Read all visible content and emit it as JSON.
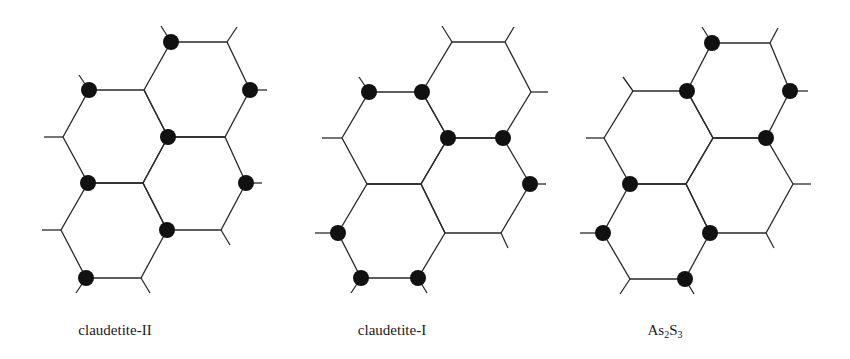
{
  "figure": {
    "colors": {
      "line": "#2a2a2a",
      "atom": "#111111",
      "background": "#ffffff"
    },
    "atom_radius": 8,
    "panels": [
      {
        "name": "claudetite-II",
        "label": "claudetite-II",
        "label_x": 115,
        "hexagons": [
          [
            [
              171,
              42
            ],
            [
              227,
              42
            ],
            [
              250,
              90
            ],
            [
              225,
              137
            ],
            [
              168,
              137
            ],
            [
              144,
              90
            ]
          ],
          [
            [
              89,
              90
            ],
            [
              144,
              90
            ],
            [
              168,
              137
            ],
            [
              143,
              183
            ],
            [
              88,
              183
            ],
            [
              63,
              137
            ]
          ],
          [
            [
              168,
              137
            ],
            [
              225,
              137
            ],
            [
              246,
              183
            ],
            [
              221,
              230
            ],
            [
              167,
              230
            ],
            [
              143,
              183
            ]
          ],
          [
            [
              88,
              183
            ],
            [
              143,
              183
            ],
            [
              167,
              230
            ],
            [
              141,
              278
            ],
            [
              86,
              278
            ],
            [
              61,
              230
            ]
          ]
        ],
        "stubs": [
          [
            [
              171,
              42
            ],
            [
              161,
              26
            ]
          ],
          [
            [
              227,
              42
            ],
            [
              237,
              27
            ]
          ],
          [
            [
              250,
              90
            ],
            [
              267,
              90
            ]
          ],
          [
            [
              89,
              90
            ],
            [
              79,
              75
            ]
          ],
          [
            [
              63,
              137
            ],
            [
              44,
              137
            ]
          ],
          [
            [
              246,
              183
            ],
            [
              262,
              183
            ]
          ],
          [
            [
              221,
              230
            ],
            [
              230,
              245
            ]
          ],
          [
            [
              61,
              230
            ],
            [
              42,
              230
            ]
          ],
          [
            [
              86,
              278
            ],
            [
              76,
              293
            ]
          ],
          [
            [
              141,
              278
            ],
            [
              150,
              293
            ]
          ]
        ],
        "atoms": [
          [
            171,
            42
          ],
          [
            89,
            90
          ],
          [
            250,
            90
          ],
          [
            168,
            137
          ],
          [
            88,
            183
          ],
          [
            246,
            183
          ],
          [
            167,
            230
          ],
          [
            86,
            278
          ]
        ]
      },
      {
        "name": "claudetite-I",
        "label": "claudetite-I",
        "label_x": 392,
        "hexagons": [
          [
            [
              452,
              42
            ],
            [
              505,
              42
            ],
            [
              531,
              92
            ],
            [
              503,
              138
            ],
            [
              448,
              138
            ],
            [
              422,
              92
            ]
          ],
          [
            [
              369,
              92
            ],
            [
              422,
              92
            ],
            [
              448,
              138
            ],
            [
              421,
              184
            ],
            [
              367,
              184
            ],
            [
              342,
              138
            ]
          ],
          [
            [
              448,
              138
            ],
            [
              503,
              138
            ],
            [
              530,
              184
            ],
            [
              501,
              233
            ],
            [
              445,
              233
            ],
            [
              421,
              184
            ]
          ],
          [
            [
              367,
              184
            ],
            [
              421,
              184
            ],
            [
              445,
              233
            ],
            [
              418,
              278
            ],
            [
              361,
              278
            ],
            [
              338,
              233
            ]
          ]
        ],
        "stubs": [
          [
            [
              452,
              42
            ],
            [
              442,
              26
            ]
          ],
          [
            [
              505,
              42
            ],
            [
              514,
              27
            ]
          ],
          [
            [
              531,
              92
            ],
            [
              548,
              92
            ]
          ],
          [
            [
              369,
              92
            ],
            [
              359,
              77
            ]
          ],
          [
            [
              342,
              138
            ],
            [
              322,
              138
            ]
          ],
          [
            [
              530,
              184
            ],
            [
              546,
              184
            ]
          ],
          [
            [
              501,
              233
            ],
            [
              508,
              248
            ]
          ],
          [
            [
              338,
              233
            ],
            [
              315,
              233
            ]
          ],
          [
            [
              361,
              278
            ],
            [
              351,
              293
            ]
          ],
          [
            [
              418,
              278
            ],
            [
              427,
              293
            ]
          ]
        ],
        "atoms": [
          [
            369,
            92
          ],
          [
            422,
            92
          ],
          [
            448,
            138
          ],
          [
            503,
            138
          ],
          [
            530,
            184
          ],
          [
            338,
            233
          ],
          [
            361,
            278
          ],
          [
            418,
            278
          ]
        ]
      },
      {
        "name": "As2S3",
        "label": "As",
        "label_sub1": "2",
        "label_mid": "S",
        "label_sub2": "3",
        "label_x": 665,
        "hexagons": [
          [
            [
              712,
              43
            ],
            [
              770,
              43
            ],
            [
              790,
              91
            ],
            [
              766,
              138
            ],
            [
              713,
              138
            ],
            [
              687,
              91
            ]
          ],
          [
            [
              633,
              91
            ],
            [
              687,
              91
            ],
            [
              713,
              138
            ],
            [
              686,
              184
            ],
            [
              630,
              184
            ],
            [
              604,
              138
            ]
          ],
          [
            [
              713,
              138
            ],
            [
              766,
              138
            ],
            [
              793,
              184
            ],
            [
              766,
              233
            ],
            [
              710,
              233
            ],
            [
              686,
              184
            ]
          ],
          [
            [
              630,
              184
            ],
            [
              686,
              184
            ],
            [
              710,
              233
            ],
            [
              685,
              279
            ],
            [
              630,
              279
            ],
            [
              603,
              233
            ]
          ]
        ],
        "stubs": [
          [
            [
              712,
              43
            ],
            [
              702,
              27
            ]
          ],
          [
            [
              770,
              43
            ],
            [
              778,
              28
            ]
          ],
          [
            [
              790,
              91
            ],
            [
              808,
              91
            ]
          ],
          [
            [
              633,
              91
            ],
            [
              623,
              77
            ]
          ],
          [
            [
              604,
              138
            ],
            [
              586,
              138
            ]
          ],
          [
            [
              793,
              184
            ],
            [
              811,
              184
            ]
          ],
          [
            [
              766,
              233
            ],
            [
              774,
              248
            ]
          ],
          [
            [
              603,
              233
            ],
            [
              580,
              233
            ]
          ],
          [
            [
              630,
              279
            ],
            [
              620,
              294
            ]
          ],
          [
            [
              685,
              279
            ],
            [
              694,
              294
            ]
          ]
        ],
        "atoms": [
          [
            712,
            43
          ],
          [
            687,
            91
          ],
          [
            790,
            91
          ],
          [
            766,
            138
          ],
          [
            630,
            184
          ],
          [
            603,
            233
          ],
          [
            710,
            233
          ],
          [
            685,
            279
          ]
        ]
      }
    ]
  }
}
